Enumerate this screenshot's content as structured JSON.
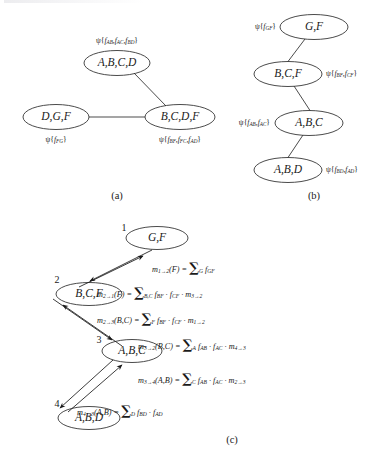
{
  "figure": {
    "caption_a": "(a)",
    "caption_b": "(b)",
    "caption_c": "(c)",
    "top_cut_text": ""
  },
  "panel_a": {
    "name": "junction-tree-clusters",
    "nodes": [
      {
        "id": "abcd",
        "label": "A,B,C,D",
        "potential": "ψ{f",
        "potential_full": "ψ{f_AB, f_AC, f_BD}"
      },
      {
        "id": "dgf",
        "label": "D,G,F",
        "potential_full": "ψ{f_FG}"
      },
      {
        "id": "bcdf",
        "label": "B,C,D,F",
        "potential_full": "ψ{f_BF, f_FC, f_AD}"
      }
    ],
    "potentials": {
      "abcd": {
        "greek": "ψ",
        "open": "{",
        "terms": [
          "f",
          "f",
          "f"
        ],
        "subs": [
          "AB",
          "AC",
          "BD"
        ],
        "close": "}"
      },
      "dgf": {
        "greek": "ψ",
        "open": "{",
        "terms": [
          "f"
        ],
        "subs": [
          "FG"
        ],
        "close": "}"
      },
      "bcdf": {
        "greek": "ψ",
        "open": "{",
        "terms": [
          "f",
          "f",
          "f"
        ],
        "subs": [
          "BF",
          "FC",
          "AD"
        ],
        "close": "}"
      }
    },
    "edges": [
      {
        "from": "abcd",
        "to": "bcdf"
      },
      {
        "from": "dgf",
        "to": "bcdf"
      }
    ]
  },
  "panel_b": {
    "name": "junction-chain-clusters",
    "nodes": [
      {
        "id": "gf",
        "label": "G,F"
      },
      {
        "id": "bcf",
        "label": "B,C,F"
      },
      {
        "id": "abc",
        "label": "A,B,C"
      },
      {
        "id": "abd",
        "label": "A,B,D"
      }
    ],
    "potentials": {
      "gf": {
        "greek": "ψ",
        "open": "{",
        "terms": [
          "f"
        ],
        "subs": [
          "GF"
        ],
        "close": "}"
      },
      "bcf": {
        "greek": "ψ",
        "open": "{",
        "terms": [
          "f",
          "f"
        ],
        "subs": [
          "BF",
          "CF"
        ],
        "close": "}"
      },
      "abc": {
        "greek": "ψ",
        "open": "{",
        "terms": [
          "f",
          "f"
        ],
        "subs": [
          "AB",
          "AC"
        ],
        "close": "}"
      },
      "abd": {
        "greek": "ψ",
        "open": "{",
        "terms": [
          "f",
          "f"
        ],
        "subs": [
          "BD",
          "AD"
        ],
        "close": "}"
      }
    },
    "edges": [
      {
        "from": "gf",
        "to": "bcf"
      },
      {
        "from": "bcf",
        "to": "abc"
      },
      {
        "from": "abc",
        "to": "abd"
      }
    ]
  },
  "panel_c": {
    "name": "message-passing-chain",
    "nodes": [
      {
        "id": "gf",
        "number": "1",
        "label": "G,F"
      },
      {
        "id": "bcf",
        "number": "2",
        "label": "B,C,F"
      },
      {
        "id": "abc",
        "number": "3",
        "label": "A,B,C"
      },
      {
        "id": "abd",
        "number": "4",
        "label": "A,B,D"
      }
    ],
    "messages": [
      {
        "id": "m12",
        "from": "1",
        "to": "2",
        "name": "m",
        "arrow": "→",
        "args": "(F)",
        "eq": "=",
        "sum_sub": "G",
        "factors": [
          {
            "f": "f",
            "sub": "GF"
          }
        ]
      },
      {
        "id": "m21",
        "from": "2",
        "to": "1",
        "name": "m",
        "arrow": "→",
        "args": "(F)",
        "eq": "=",
        "sum_sub": "B,C",
        "factors": [
          {
            "f": "f",
            "sub": "BF"
          },
          {
            "f": "f",
            "sub": "CF"
          },
          {
            "f": "m",
            "sub": "3→2",
            "is_msg": true
          }
        ]
      },
      {
        "id": "m23",
        "from": "2",
        "to": "3",
        "name": "m",
        "arrow": "→",
        "args": "(B,C)",
        "eq": "=",
        "sum_sub": "F",
        "factors": [
          {
            "f": "f",
            "sub": "BF"
          },
          {
            "f": "f",
            "sub": "CF"
          },
          {
            "f": "m",
            "sub": "1→2",
            "is_msg": true
          }
        ]
      },
      {
        "id": "m32",
        "from": "3",
        "to": "2",
        "name": "m",
        "arrow": "→",
        "args": "(B,C)",
        "eq": "=",
        "sum_sub": "A",
        "factors": [
          {
            "f": "f",
            "sub": "AB"
          },
          {
            "f": "f",
            "sub": "AC"
          },
          {
            "f": "m",
            "sub": "4→3",
            "is_msg": true
          }
        ]
      },
      {
        "id": "m34",
        "from": "3",
        "to": "4",
        "name": "m",
        "arrow": "→",
        "args": "(A,B)",
        "eq": "=",
        "sum_sub": "C",
        "factors": [
          {
            "f": "f",
            "sub": "AB"
          },
          {
            "f": "f",
            "sub": "AC"
          },
          {
            "f": "m",
            "sub": "2→3",
            "is_msg": true
          }
        ]
      },
      {
        "id": "m43",
        "from": "4",
        "to": "3",
        "name": "m",
        "arrow": "→",
        "args": "(A,B)",
        "eq": "=",
        "sum_sub": "D",
        "factors": [
          {
            "f": "f",
            "sub": "BD"
          },
          {
            "f": "f",
            "sub": "AD"
          }
        ]
      }
    ]
  },
  "style": {
    "ink": "#1a1a1a",
    "stroke": "#2b2b2b"
  }
}
